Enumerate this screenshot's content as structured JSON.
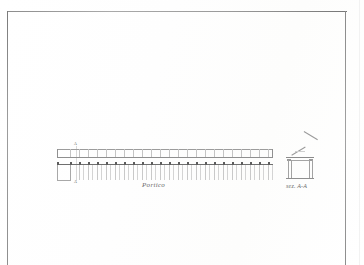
{
  "sheet": {
    "medium": "architectural drawing on paper (scanned)",
    "background_color": "#fdfdfd",
    "border_color": "#9a9a9a"
  },
  "drawings": [
    {
      "id": "plan",
      "caption": "Portico",
      "type": "plan",
      "bays": 24,
      "section_markers": [
        "A",
        "A"
      ]
    },
    {
      "id": "section",
      "caption": "sez. A-A",
      "type": "cross-section",
      "columns": 2
    }
  ],
  "captions": {
    "plan": "Portico",
    "section": "sez. A-A"
  },
  "markers": {
    "cut_top": "A",
    "cut_bottom": "A"
  },
  "ink_colors": {
    "heavy_line": "#6f6f6f",
    "medium_line": "#9a9a9a",
    "light_line": "#c9c9c9",
    "text": "#6a6a6a"
  }
}
